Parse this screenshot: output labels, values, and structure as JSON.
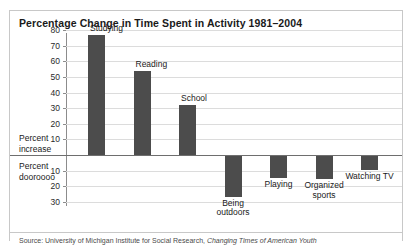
{
  "title": "Percentage Change in Time Spent in Activity 1981–2004",
  "axis_side_labels": {
    "positive": "Percent increase",
    "negative": "Percent dooroooo"
  },
  "source": {
    "prefix": "Source: University of Michigan Institute for Social Research, ",
    "italic": "Changing Times of American Youth"
  },
  "chart_data": {
    "type": "bar",
    "title": "Percentage Change in Time Spent in Activity 1981–2004",
    "xlabel": "",
    "ylabel": "Percent change",
    "ylim": [
      -30,
      80
    ],
    "grid": true,
    "legend": "none",
    "ytick_labels_positive": [
      "80",
      "70",
      "60",
      "50",
      "40",
      "30",
      "20",
      "10"
    ],
    "ytick_labels_negative": [
      "10",
      "20",
      "30"
    ],
    "ytick_values": [
      80,
      70,
      60,
      50,
      40,
      30,
      20,
      10,
      -10,
      -20,
      -30
    ],
    "categories": [
      "Studying",
      "Reading",
      "School",
      "Being outdoors",
      "Playing",
      "Organized sports",
      "Watching TV"
    ],
    "values": [
      77,
      54,
      32,
      -26,
      -14,
      -15,
      -9
    ]
  }
}
